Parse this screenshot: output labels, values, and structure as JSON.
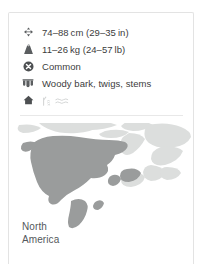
{
  "card": {
    "facts": [
      {
        "icon": "size-arrows-icon",
        "label": "74–88 cm (29–35 in)",
        "field": "length"
      },
      {
        "icon": "weight-scale-icon",
        "label": "11–26 kg (24–57 lb)",
        "field": "weight"
      },
      {
        "icon": "conservation-status-icon",
        "label": "Common",
        "field": "conservation_status"
      },
      {
        "icon": "teeth-diet-icon",
        "label": "Woody bark, twigs, stems",
        "field": "diet"
      },
      {
        "icon": "habitat-home-icon",
        "label": "",
        "field": "habitat"
      }
    ],
    "map": {
      "caption_line1": "North",
      "caption_line2": "America",
      "highlight_color": "#9a9c9c",
      "base_color": "#dcdedd",
      "background_color": "#ffffff"
    }
  }
}
